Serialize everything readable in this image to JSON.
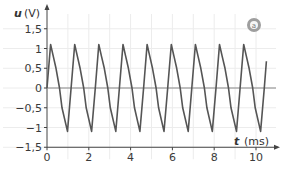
{
  "chart_data": {
    "type": "line",
    "title": "",
    "xlabel": "t",
    "xunit": "(ms)",
    "ylabel": "u",
    "yunit": "(V)",
    "xlim": [
      0,
      10.9
    ],
    "ylim": [
      -1.5,
      1.5
    ],
    "x_ticks": [
      0,
      2,
      4,
      6,
      8,
      10
    ],
    "x_tick_labels": [
      "0",
      "2",
      "4",
      "6",
      "8",
      "10"
    ],
    "y_ticks": [
      1.5,
      1,
      0.5,
      0,
      -0.5,
      -1,
      -1.5
    ],
    "y_tick_labels": [
      "1,5",
      "1",
      "0,5",
      "0",
      "−0,5",
      "−1",
      "−1,5"
    ],
    "grid": true,
    "grid_x_step": 1,
    "grid_y_step": 0.5,
    "badge": "a",
    "series": [
      {
        "name": "u(t)",
        "period_ms": 1.155,
        "cycles": 9,
        "end_t": 10.5,
        "one_period_shape": [
          [
            0.0,
            0.0
          ],
          [
            0.17,
            1.1
          ],
          [
            0.3,
            0.8
          ],
          [
            0.43,
            0.5
          ],
          [
            0.6,
            0.0
          ],
          [
            0.72,
            -0.5
          ],
          [
            0.98,
            -1.1
          ],
          [
            1.155,
            0.0
          ]
        ],
        "color": "#555555"
      }
    ]
  }
}
